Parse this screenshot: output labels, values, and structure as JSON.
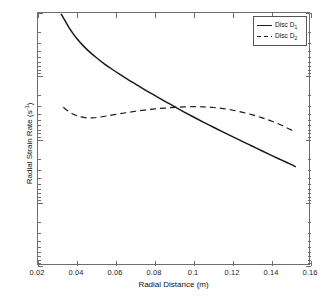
{
  "chart_data": {
    "type": "line",
    "title": "",
    "xlabel": "Radial Distance (m)",
    "ylabel": "Radial Strain Rate (s⁻¹)",
    "ylabel_base": "Radial Strain Rate (s",
    "ylabel_exp": "-1",
    "ylabel_tail": ")",
    "xlim": [
      0.02,
      0.16
    ],
    "ylim_log_negative": [
      -1e-06,
      -0.01
    ],
    "yscale": "log-negative-reversed",
    "grid": false,
    "xticks": [
      0.02,
      0.04,
      0.06,
      0.08,
      0.1,
      0.12,
      0.14,
      0.16
    ],
    "xticklabels": [
      "0.02",
      "0.04",
      "0.06",
      "0.08",
      "0.1",
      "0.12",
      "0.14",
      "0.16"
    ],
    "yticks": [
      -1e-06,
      -1e-05,
      -0.0001,
      -0.001,
      -0.01
    ],
    "yticklabels": [
      "-10",
      "-10",
      "-10",
      "-10",
      "-10"
    ],
    "ytickexps": [
      "-6",
      "-5",
      "-4",
      "-3",
      "-2"
    ],
    "legend_position": "top-right",
    "legend": [
      "Disc D₁",
      "Disc D₂"
    ],
    "series": [
      {
        "name": "Disc D1",
        "label_base": "Disc D",
        "label_sub": "1",
        "style": "solid",
        "color": "#1a1a1a",
        "x": [
          0.032,
          0.034,
          0.036,
          0.038,
          0.04,
          0.043,
          0.046,
          0.05,
          0.054,
          0.058,
          0.062,
          0.066,
          0.07,
          0.074,
          0.078,
          0.082,
          0.086,
          0.09,
          0.095,
          0.1,
          0.105,
          0.11,
          0.115,
          0.12,
          0.125,
          0.13,
          0.135,
          0.14,
          0.145,
          0.15,
          0.152
        ],
        "y": [
          -1.05e-06,
          -1.35e-06,
          -1.72e-06,
          -2.12e-06,
          -2.55e-06,
          -3.25e-06,
          -4e-06,
          -5.1e-06,
          -6.35e-06,
          -7.75e-06,
          -9.35e-06,
          -1.12e-05,
          -1.33e-05,
          -1.58e-05,
          -1.87e-05,
          -2.2e-05,
          -2.58e-05,
          -3.02e-05,
          -3.68e-05,
          -4.45e-05,
          -5.35e-05,
          -6.4e-05,
          -7.65e-05,
          -9.1e-05,
          -0.000108,
          -0.000128,
          -0.000152,
          -0.00018,
          -0.000212,
          -0.00025,
          -0.000268
        ]
      },
      {
        "name": "Disc D2",
        "label_base": "Disc D",
        "label_sub": "2",
        "style": "dashed",
        "color": "#1a1a1a",
        "x": [
          0.033,
          0.036,
          0.039,
          0.042,
          0.045,
          0.048,
          0.051,
          0.055,
          0.06,
          0.065,
          0.07,
          0.075,
          0.08,
          0.085,
          0.09,
          0.095,
          0.1,
          0.105,
          0.11,
          0.115,
          0.12,
          0.125,
          0.13,
          0.135,
          0.14,
          0.145,
          0.15,
          0.152
        ],
        "y": [
          -3.1e-05,
          -3.65e-05,
          -4.1e-05,
          -4.4e-05,
          -4.55e-05,
          -4.55e-05,
          -4.45e-05,
          -4.25e-05,
          -4e-05,
          -3.78e-05,
          -3.58e-05,
          -3.42e-05,
          -3.28e-05,
          -3.18e-05,
          -3.1e-05,
          -3.05e-05,
          -3.03e-05,
          -3.05e-05,
          -3.12e-05,
          -3.25e-05,
          -3.45e-05,
          -3.72e-05,
          -4.08e-05,
          -4.55e-05,
          -5.15e-05,
          -5.95e-05,
          -7.1e-05,
          -7.7e-05
        ]
      }
    ],
    "annotations": [
      {
        "note": "curves intersect near x=0.085, y=-3.2e-5"
      }
    ]
  }
}
